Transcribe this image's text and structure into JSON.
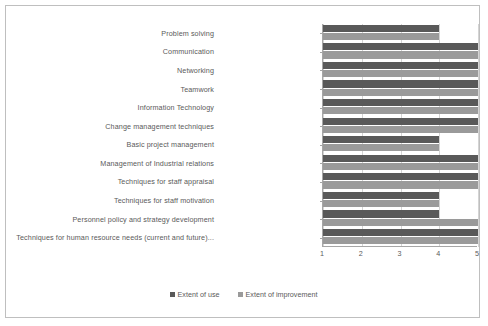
{
  "chart_data": {
    "type": "bar",
    "orientation": "horizontal",
    "title": "",
    "xlabel": "",
    "ylabel": "",
    "xlim": [
      1,
      5
    ],
    "xticks": [
      "1",
      "2",
      "3",
      "4",
      "5"
    ],
    "grid": true,
    "legend_position": "bottom-center",
    "categories": [
      "Problem solving",
      "Communication",
      "Networking",
      "Teamwork",
      "Information Technology",
      "Change management techniques",
      "Basic project management",
      "Management of Industrial relations",
      "Techniques for staff appraisal",
      "Techniques for staff motivation",
      "Personnel policy and strategy development",
      "Techniques for human resource needs (current and future)..."
    ],
    "series": [
      {
        "name": "Extent of use",
        "color": "#595959",
        "values": [
          4,
          5,
          5,
          5,
          5,
          5,
          4,
          5,
          5,
          4,
          4,
          5
        ]
      },
      {
        "name": "Extent of improvement",
        "color": "#9a9a9a",
        "values": [
          4,
          5,
          5,
          5,
          5,
          5,
          4,
          5,
          5,
          4,
          5,
          5
        ]
      }
    ]
  },
  "legend": {
    "items": [
      {
        "label": "Extent of use",
        "color": "#595959"
      },
      {
        "label": "Extent of improvement",
        "color": "#9a9a9a"
      }
    ]
  },
  "axis": {
    "tick_labels": [
      "1",
      "2",
      "3",
      "4",
      "5"
    ],
    "axis_color": "#a6a6a6",
    "grid_color": "#d4d4d4"
  },
  "frame": {
    "border_color": "#bfbfbf",
    "background": "#ffffff"
  }
}
